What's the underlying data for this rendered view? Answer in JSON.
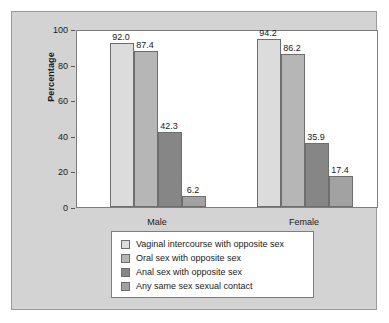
{
  "chart_data": {
    "type": "bar",
    "title": "",
    "xlabel": "",
    "ylabel": "Percentage",
    "ylim": [
      0,
      100
    ],
    "yticks": [
      0,
      20,
      40,
      60,
      80,
      100
    ],
    "ytick_labels": [
      "0",
      "20",
      "40",
      "60",
      "80",
      "100"
    ],
    "grid": false,
    "legend_position": "below-plot",
    "categories": [
      "Male",
      "Female"
    ],
    "series": [
      {
        "name": "Vaginal intercourse with opposite sex",
        "color": "#dcdcdc",
        "values": [
          92.0,
          94.2
        ],
        "labels": [
          "92.0",
          "94.2"
        ]
      },
      {
        "name": "Oral sex with opposite sex",
        "color": "#b6b6b6",
        "values": [
          87.4,
          86.2
        ],
        "labels": [
          "87.4",
          "86.2"
        ]
      },
      {
        "name": "Anal sex with opposite sex",
        "color": "#868686",
        "values": [
          42.3,
          35.9
        ],
        "labels": [
          "42.3",
          "35.9"
        ]
      },
      {
        "name": "Any same sex sexual contact",
        "color": "#a2a2a2",
        "values": [
          6.2,
          17.4
        ],
        "labels": [
          "6.2",
          "17.4"
        ]
      }
    ]
  }
}
